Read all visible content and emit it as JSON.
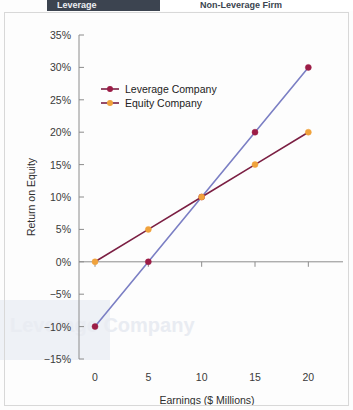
{
  "page": {
    "header_left_fragment": "Leverage",
    "header_right_fragment": "Non-Leverage Firm",
    "bleed_text_fragment": "Leverage Company"
  },
  "chart_data": {
    "type": "line",
    "title": "",
    "xlabel": "Earnings ($ Millions)",
    "ylabel": "Return on Equity",
    "x": [
      0,
      5,
      10,
      15,
      20
    ],
    "xlim": [
      -1.5,
      22.5
    ],
    "ylim": [
      -15,
      35
    ],
    "xticks": [
      0,
      5,
      10,
      15,
      20
    ],
    "xtick_labels": [
      "0",
      "5",
      "10",
      "15",
      "20"
    ],
    "yticks": [
      -15,
      -10,
      -5,
      0,
      5,
      10,
      15,
      20,
      25,
      30,
      35
    ],
    "ytick_labels": [
      "−15%",
      "−10%",
      "−5%",
      "0%",
      "5%",
      "10%",
      "15%",
      "20%",
      "25%",
      "30%",
      "35%"
    ],
    "grid": false,
    "legend_position": "upper left",
    "series": [
      {
        "name": "Leverage Company",
        "x": [
          0,
          5,
          10,
          15,
          20
        ],
        "values": [
          -10,
          0,
          10,
          20,
          30
        ],
        "line_color": "#7b7fc4",
        "marker_color": "#9c1c46"
      },
      {
        "name": "Equity Company",
        "x": [
          0,
          5,
          10,
          15,
          20
        ],
        "values": [
          0,
          5,
          10,
          15,
          20
        ],
        "line_color": "#7b1f43",
        "marker_color": "#f0a23c"
      }
    ]
  }
}
